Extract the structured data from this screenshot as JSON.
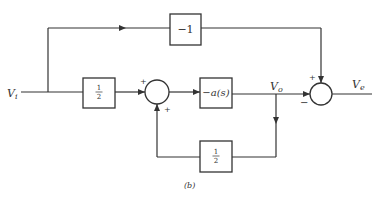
{
  "diagram": {
    "type": "block-diagram",
    "caption": "(b)",
    "signals": {
      "input": {
        "name": "V",
        "sub": "i"
      },
      "output": {
        "name": "V",
        "sub": "o"
      },
      "error": {
        "name": "V",
        "sub": "e"
      }
    },
    "blocks": {
      "top_gain": "−1",
      "input_gain_num": "1",
      "input_gain_den": "2",
      "amplifier": "−a(s)",
      "feedback_gain_num": "1",
      "feedback_gain_den": "2"
    },
    "summer1": {
      "top_sign": "+",
      "bottom_sign": "+"
    },
    "summer2": {
      "top_sign": "+",
      "left_sign": "−"
    }
  }
}
